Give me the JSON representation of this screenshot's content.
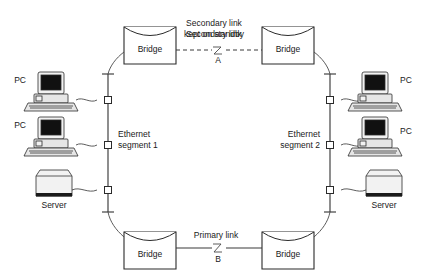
{
  "diagram": {
    "background_color": "#ffffff",
    "line_color": "#2b2b2b"
  },
  "labels": {
    "secondary_link_line1": "Secondary link",
    "secondary_link_line2": "kept on standby",
    "point_a": "A",
    "primary_link": "Primary link",
    "point_b": "B",
    "ethernet_segment_1_line1": "Ethernet",
    "ethernet_segment_1_line2": "segment 1",
    "ethernet_segment_2_line1": "Ethernet",
    "ethernet_segment_2_line2": "segment 2"
  },
  "bridges": [
    {
      "id": "bridge-top-left",
      "label": "Bridge"
    },
    {
      "id": "bridge-top-right",
      "label": "Bridge"
    },
    {
      "id": "bridge-bottom-left",
      "label": "Bridge"
    },
    {
      "id": "bridge-bottom-right",
      "label": "Bridge"
    }
  ],
  "left_segment": {
    "name": "Ethernet segment 1",
    "devices": [
      {
        "id": "pc-left-1",
        "type": "pc",
        "label": "PC"
      },
      {
        "id": "pc-left-2",
        "type": "pc",
        "label": "PC"
      },
      {
        "id": "server-left",
        "type": "server",
        "label": "Server"
      }
    ]
  },
  "right_segment": {
    "name": "Ethernet segment 2",
    "devices": [
      {
        "id": "pc-right-1",
        "type": "pc",
        "label": "PC"
      },
      {
        "id": "pc-right-2",
        "type": "pc",
        "label": "PC"
      },
      {
        "id": "server-right",
        "type": "server",
        "label": "Server"
      }
    ]
  },
  "links": [
    {
      "id": "link-secondary",
      "label": "Secondary link kept on standby",
      "point": "A",
      "style": "dashed",
      "state": "standby"
    },
    {
      "id": "link-primary",
      "label": "Primary link",
      "point": "B",
      "style": "solid",
      "state": "active"
    }
  ]
}
